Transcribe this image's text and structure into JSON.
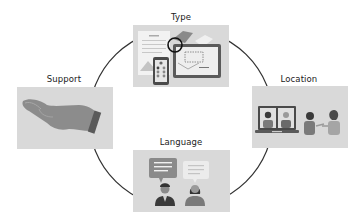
{
  "diagram": {
    "type": "cycle",
    "nodes": [
      {
        "id": "type",
        "label": "Type",
        "icon": "documents-devices-icon",
        "position": "top"
      },
      {
        "id": "location",
        "label": "Location",
        "icon": "video-call-in-person-icon",
        "position": "right"
      },
      {
        "id": "language",
        "label": "Language",
        "icon": "speech-bubbles-people-icon",
        "position": "bottom"
      },
      {
        "id": "support",
        "label": "Support",
        "icon": "open-hand-icon",
        "position": "left"
      }
    ],
    "connector": "circle-arc",
    "colors": {
      "panel_bg": "#d9d9d9",
      "line": "#333333",
      "icon_dark": "#555555",
      "icon_mid": "#8a8a8a",
      "icon_light": "#bdbdbd"
    }
  }
}
